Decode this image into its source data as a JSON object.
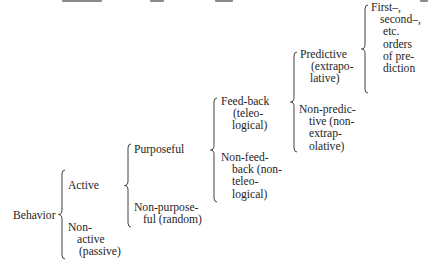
{
  "diagram": {
    "root": {
      "label": "Behavior",
      "children": [
        {
          "label": "Active",
          "children": [
            {
              "label": "Purposeful",
              "children": [
                {
                  "label": "Feed-back (teleological)",
                  "children": [
                    {
                      "label": "Predictive (extrapolative)",
                      "children": [
                        {
                          "label": "First–, second–, etc. orders of prediction"
                        }
                      ]
                    },
                    {
                      "label": "Non-predictive (non-extrapolative)"
                    }
                  ]
                },
                {
                  "label": "Non-feed-back (non-teleological)"
                }
              ]
            },
            {
              "label": "Non-purposeful (random)"
            }
          ]
        },
        {
          "label": "Non-active (passive)"
        }
      ]
    }
  },
  "nodes": {
    "behavior": {
      "lines": [
        "Behavior"
      ]
    },
    "active": {
      "lines": [
        "Active"
      ]
    },
    "non_active": {
      "lines": [
        "Non-",
        "active",
        "(passive)"
      ]
    },
    "purposeful": {
      "lines": [
        "Purposeful"
      ]
    },
    "non_purposeful": {
      "lines": [
        "Non-purpose-",
        "ful (random)"
      ]
    },
    "feedback": {
      "lines": [
        "Feed-back",
        "(teleo-",
        "logical)"
      ]
    },
    "non_feedback": {
      "lines": [
        "Non-feed-",
        "back (non-",
        "teleo-",
        "logical)"
      ]
    },
    "predictive": {
      "lines": [
        "Predictive",
        "(extrapo-",
        "lative)"
      ]
    },
    "non_predictive": {
      "lines": [
        "Non-predic-",
        "tive (non-",
        "extrap-",
        "olative)"
      ]
    },
    "orders": {
      "lines": [
        "First–,",
        "second–,",
        "etc.",
        "orders",
        "of pre-",
        "diction"
      ]
    }
  },
  "colors": {
    "text": "#1e1e1e",
    "brace": "#2b2b2b",
    "background": "#ffffff"
  }
}
